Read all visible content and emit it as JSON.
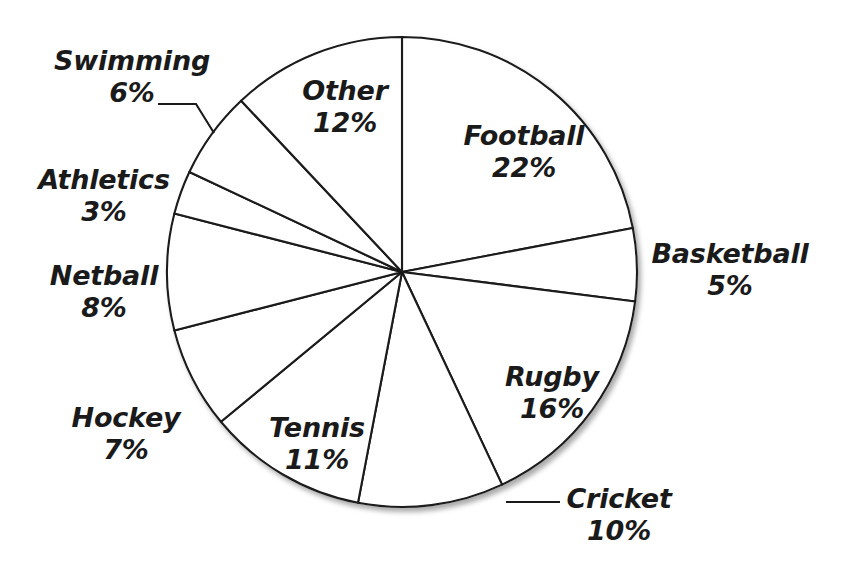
{
  "chart_data": {
    "type": "pie",
    "title": "",
    "subtitle": "",
    "xlabel": "",
    "ylabel": "",
    "units": "percent",
    "total": 100,
    "legend_position": "none",
    "grid": false,
    "start_angle_deg": 0,
    "direction": "clockwise",
    "categories": [
      "Football",
      "Basketball",
      "Rugby",
      "Cricket",
      "Tennis",
      "Hockey",
      "Netball",
      "Athletics",
      "Swimming",
      "Other"
    ],
    "values": [
      22,
      5,
      16,
      10,
      11,
      7,
      8,
      3,
      6,
      12
    ],
    "slice_fill": "#ffffff",
    "slice_stroke": "#1a1a1a",
    "slices": [
      {
        "name": "Football",
        "value": 22,
        "value_label": "22%",
        "label_x": 524,
        "label_y": 152,
        "leader": false
      },
      {
        "name": "Basketball",
        "value": 5,
        "value_label": "5%",
        "label_x": 730,
        "label_y": 270,
        "leader": false
      },
      {
        "name": "Rugby",
        "value": 16,
        "value_label": "16%",
        "label_x": 552,
        "label_y": 393,
        "leader": false
      },
      {
        "name": "Cricket",
        "value": 10,
        "value_label": "10%",
        "label_x": 619,
        "label_y": 515,
        "leader": true
      },
      {
        "name": "Tennis",
        "value": 11,
        "value_label": "11%",
        "label_x": 317,
        "label_y": 444,
        "leader": false
      },
      {
        "name": "Hockey",
        "value": 7,
        "value_label": "7%",
        "label_x": 126,
        "label_y": 434,
        "leader": false
      },
      {
        "name": "Netball",
        "value": 8,
        "value_label": "8%",
        "label_x": 104,
        "label_y": 292,
        "leader": false
      },
      {
        "name": "Athletics",
        "value": 3,
        "value_label": "3%",
        "label_x": 104,
        "label_y": 196,
        "leader": false
      },
      {
        "name": "Swimming",
        "value": 6,
        "value_label": "6%",
        "label_x": 132,
        "label_y": 77,
        "leader": true
      },
      {
        "name": "Other",
        "value": 12,
        "value_label": "12%",
        "label_x": 345,
        "label_y": 107,
        "leader": false
      }
    ]
  },
  "labels": {
    "football": {
      "name": "Football",
      "value": "22%"
    },
    "basketball": {
      "name": "Basketball",
      "value": "5%"
    },
    "rugby": {
      "name": "Rugby",
      "value": "16%"
    },
    "cricket": {
      "name": "Cricket",
      "value": "10%"
    },
    "tennis": {
      "name": "Tennis",
      "value": "11%"
    },
    "hockey": {
      "name": "Hockey",
      "value": "7%"
    },
    "netball": {
      "name": "Netball",
      "value": "8%"
    },
    "athletics": {
      "name": "Athletics",
      "value": "3%"
    },
    "swimming": {
      "name": "Swimming",
      "value": "6%"
    },
    "other": {
      "name": "Other",
      "value": "12%"
    }
  },
  "geometry": {
    "center_x": 402,
    "center_y": 272,
    "radius": 235
  },
  "colors": {
    "background": "#ffffff",
    "stroke": "#1a1a1a",
    "text": "#1a1a1a"
  }
}
